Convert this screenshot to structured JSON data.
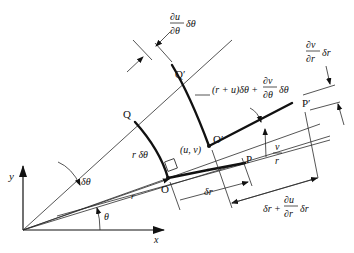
{
  "diagram": {
    "axes": {
      "x_label": "x",
      "y_label": "y"
    },
    "points": {
      "O": "O",
      "P": "P",
      "Q": "Q",
      "O_prime": "O′",
      "P_prime": "P′",
      "Q_prime": "Q′",
      "displacement": "(u, v)"
    },
    "angles": {
      "theta": "θ",
      "dtheta": "δθ"
    },
    "lengths": {
      "r": "r",
      "r_dtheta": "r δθ",
      "dr": "δr",
      "v_over_r_num": "v",
      "v_over_r_den": "r",
      "du_dtheta_num": "∂u",
      "du_dtheta_den": "∂θ",
      "du_dtheta_tail": "δθ",
      "arc_prime_main": "(r + u)δθ +",
      "dv_dtheta_num": "∂v",
      "dv_dtheta_den": "∂θ",
      "dv_dtheta_tail": "δθ",
      "dv_dr_num": "∂v",
      "dv_dr_den": "∂r",
      "dv_dr_tail": "δr",
      "dr_plus_main": "δr +",
      "du_dr_num": "∂u",
      "du_dr_den": "∂r",
      "du_dr_tail": "δr"
    },
    "colors": {
      "ink": "#111111",
      "background": "#ffffff"
    }
  }
}
